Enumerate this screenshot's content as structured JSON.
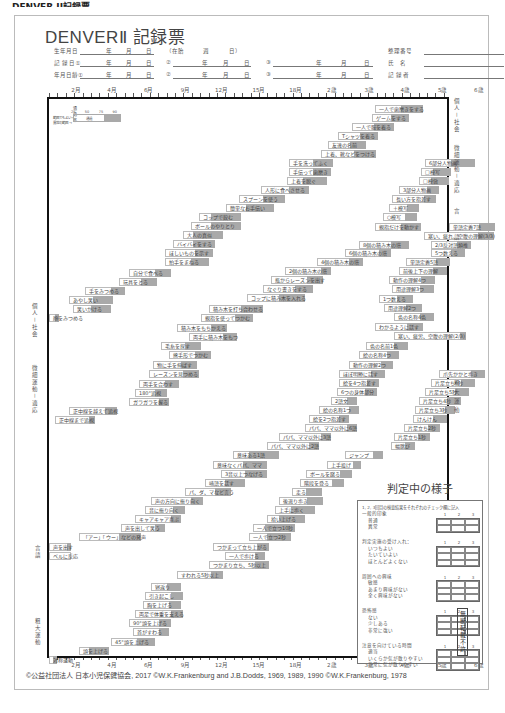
{
  "top_caption": "DENVER II記録票",
  "form": {
    "title": "DENVERⅡ 記録票",
    "rows": [
      {
        "label": "生年月日",
        "fields": [
          "年",
          "月",
          "日"
        ],
        "extra": [
          "（在胎",
          "週",
          "日）"
        ],
        "right_label": "整理番号"
      },
      {
        "label": "記 録 日①",
        "fields": [
          "年",
          "月",
          "日"
        ],
        "second": [
          "②",
          "年",
          "月",
          "日"
        ],
        "third": [
          "③",
          "年",
          "月",
          "日"
        ],
        "right_label": "氏　名"
      },
      {
        "label": "年月日齢①",
        "fields": [
          "年",
          "月",
          "日"
        ],
        "second": [
          "②",
          "年",
          "月",
          "日"
        ],
        "third": [
          "③",
          "年",
          "月",
          "日"
        ],
        "right_label": "記 録 者"
      }
    ]
  },
  "axis": {
    "labels": [
      "2月",
      "4月",
      "6月",
      "9月",
      "12月",
      "15月",
      "18月",
      "2歳",
      "3歳",
      "4歳",
      "5歳",
      "6歳"
    ],
    "positions": [
      78,
      128,
      178,
      228,
      278,
      328,
      378,
      428,
      478,
      528,
      578,
      628
    ]
  },
  "legend": {
    "title": "通過率",
    "ticks": [
      "25",
      "50",
      "75",
      "90"
    ],
    "left_top": "範囲でもよい→",
    "left_bottom": "異常の範囲 →",
    "mid": "通過"
  },
  "categories_right": [
    "個人－社会",
    "微細運動－適応",
    "言語",
    "粗大運動"
  ],
  "categories_left": [
    "個人－社会",
    "微細運動－適応",
    "言語",
    "粗大運動"
  ],
  "chart_data": {
    "type": "table",
    "title": "DENVERⅡ 記録票",
    "xlabel": "月齢・年齢",
    "x_ticks": [
      "2月",
      "4月",
      "6月",
      "9月",
      "12月",
      "15月",
      "18月",
      "2歳",
      "3歳",
      "4歳",
      "5歳",
      "6歳"
    ],
    "items": [
      {
        "label": "一人で歯磨きをする",
        "x": 326,
        "y": 6,
        "w": 48,
        "s": 22
      },
      {
        "label": "ゲームをする",
        "x": 323,
        "y": 15,
        "w": 37,
        "s": 18
      },
      {
        "label": "一人で服を着る",
        "x": 303,
        "y": 24,
        "w": 42,
        "s": 20
      },
      {
        "label": "Tシャツを着る",
        "x": 289,
        "y": 33,
        "w": 40,
        "s": 18
      },
      {
        "label": "友達の名前",
        "x": 279,
        "y": 42,
        "w": 38,
        "s": 16
      },
      {
        "label": "上着、靴などをつける",
        "x": 272,
        "y": 51,
        "w": 55,
        "s": 22
      },
      {
        "label": "手を洗ってふく",
        "x": 240,
        "y": 60,
        "w": 44,
        "s": 20
      },
      {
        "label": "手伝って歯磨き",
        "x": 240,
        "y": 69,
        "w": 42,
        "s": 18
      },
      {
        "label": "上着を脱ぐ",
        "x": 238,
        "y": 78,
        "w": 40,
        "s": 24
      },
      {
        "label": "人形に食べさせる",
        "x": 212,
        "y": 87,
        "w": 48,
        "s": 20
      },
      {
        "label": "スプーンを使う",
        "x": 190,
        "y": 96,
        "w": 46,
        "s": 22
      },
      {
        "label": "簡単なお手伝い",
        "x": 177,
        "y": 105,
        "w": 48,
        "s": 28
      },
      {
        "label": "コップで飲む",
        "x": 150,
        "y": 114,
        "w": 42,
        "s": 30
      },
      {
        "label": "ボールのやりとり",
        "x": 142,
        "y": 123,
        "w": 50,
        "s": 30
      },
      {
        "label": "大人の真似",
        "x": 134,
        "y": 132,
        "w": 40,
        "s": 30
      },
      {
        "label": "バイバイをする",
        "x": 124,
        "y": 141,
        "w": 42,
        "s": 22
      },
      {
        "label": "ほしいものを示す",
        "x": 116,
        "y": 150,
        "w": 48,
        "s": 18
      },
      {
        "label": "拍手をまねる",
        "x": 116,
        "y": 159,
        "w": 44,
        "s": 18
      },
      {
        "label": "自分で食べる",
        "x": 80,
        "y": 170,
        "w": 42,
        "s": 16
      },
      {
        "label": "玩具をとる",
        "x": 70,
        "y": 179,
        "w": 38,
        "s": 16
      },
      {
        "label": "手をみつめる",
        "x": 36,
        "y": 188,
        "w": 40,
        "s": 14
      },
      {
        "label": "あやし笑い",
        "x": 20,
        "y": 197,
        "w": 44,
        "s": 20
      },
      {
        "label": "笑いかける",
        "x": 24,
        "y": 206,
        "w": 38,
        "s": 20
      },
      {
        "label": "顔をみつめる",
        "x": 0,
        "y": 215,
        "w": 10,
        "s": 4
      },
      {
        "label": "6部分人物画",
        "x": 376,
        "y": 60,
        "w": 50,
        "s": 24
      },
      {
        "label": "□模写",
        "x": 372,
        "y": 69,
        "w": 30,
        "s": 18
      },
      {
        "label": "□模倣",
        "x": 370,
        "y": 78,
        "w": 30,
        "s": 18
      },
      {
        "label": "3部分人物画",
        "x": 350,
        "y": 87,
        "w": 40,
        "s": 12
      },
      {
        "label": "長い方を指差す",
        "x": 343,
        "y": 96,
        "w": 44,
        "s": 12
      },
      {
        "label": "＋模写",
        "x": 340,
        "y": 105,
        "w": 30,
        "s": 12
      },
      {
        "label": "○模写",
        "x": 334,
        "y": 114,
        "w": 34,
        "s": 12
      },
      {
        "label": "親指だけを動かす",
        "x": 326,
        "y": 124,
        "w": 46,
        "s": 20
      },
      {
        "label": "8個の積み木の塔",
        "x": 310,
        "y": 142,
        "w": 50,
        "s": 18
      },
      {
        "label": "6個の積み木の塔",
        "x": 296,
        "y": 150,
        "w": 46,
        "s": 12
      },
      {
        "label": "4個の積み木の塔",
        "x": 268,
        "y": 159,
        "w": 46,
        "s": 14
      },
      {
        "label": "2個の積み木の塔",
        "x": 236,
        "y": 168,
        "w": 46,
        "s": 10
      },
      {
        "label": "瓶からレーズンを出す",
        "x": 222,
        "y": 177,
        "w": 52,
        "s": 16
      },
      {
        "label": "なぐり書きをする",
        "x": 214,
        "y": 186,
        "w": 50,
        "s": 18
      },
      {
        "label": "コップに積み木を入れる",
        "x": 198,
        "y": 195,
        "w": 58,
        "s": 26
      },
      {
        "label": "積み木を打ち合わせる",
        "x": 160,
        "y": 206,
        "w": 54,
        "s": 22
      },
      {
        "label": "親指を使ってつかむ",
        "x": 152,
        "y": 215,
        "w": 52,
        "s": 18
      },
      {
        "label": "積み木をもちかえる",
        "x": 128,
        "y": 225,
        "w": 50,
        "s": 16
      },
      {
        "label": "両手に積み木をもつ",
        "x": 140,
        "y": 234,
        "w": 48,
        "s": 14
      },
      {
        "label": "毛糸を探す",
        "x": 112,
        "y": 243,
        "w": 40,
        "s": 16
      },
      {
        "label": "熊手形でつかむ",
        "x": 120,
        "y": 252,
        "w": 42,
        "s": 16
      },
      {
        "label": "物に手を伸ばす",
        "x": 104,
        "y": 262,
        "w": 44,
        "s": 16
      },
      {
        "label": "レーズンを見つめる",
        "x": 100,
        "y": 271,
        "w": 50,
        "s": 16
      },
      {
        "label": "両手を合わす",
        "x": 90,
        "y": 281,
        "w": 40,
        "s": 14
      },
      {
        "label": "180°追視",
        "x": 86,
        "y": 290,
        "w": 32,
        "s": 12
      },
      {
        "label": "ガラガラを握る",
        "x": 80,
        "y": 299,
        "w": 40,
        "s": 10
      },
      {
        "label": "正中線を越えて追視",
        "x": 20,
        "y": 308,
        "w": 48,
        "s": 12
      },
      {
        "label": "正中線まで追視",
        "x": 6,
        "y": 317,
        "w": 40,
        "s": 6
      },
      {
        "label": "単語定義7語",
        "x": 400,
        "y": 124,
        "w": 46,
        "s": 16
      },
      {
        "label": "寒い、疲れ、空腹の理解(3/3)",
        "x": 375,
        "y": 133,
        "w": 70,
        "s": 16
      },
      {
        "label": "2/3反対語類推",
        "x": 382,
        "y": 142,
        "w": 40,
        "s": 14
      },
      {
        "label": "5つ数える",
        "x": 382,
        "y": 150,
        "w": 34,
        "s": 14
      },
      {
        "label": "単語定義5語",
        "x": 357,
        "y": 159,
        "w": 44,
        "s": 14
      },
      {
        "label": "前後上下の理解",
        "x": 350,
        "y": 168,
        "w": 48,
        "s": 14
      },
      {
        "label": "動作の理解4つ",
        "x": 340,
        "y": 177,
        "w": 46,
        "s": 14
      },
      {
        "label": "用途理解3つ",
        "x": 343,
        "y": 186,
        "w": 42,
        "s": 14
      },
      {
        "label": "1つ数える",
        "x": 330,
        "y": 196,
        "w": 34,
        "s": 16
      },
      {
        "label": "用途理解2つ",
        "x": 335,
        "y": 205,
        "w": 38,
        "s": 16
      },
      {
        "label": "色の名称4色",
        "x": 345,
        "y": 214,
        "w": 40,
        "s": 14
      },
      {
        "label": "わかるように話す",
        "x": 326,
        "y": 224,
        "w": 48,
        "s": 16
      },
      {
        "label": "寒い、疲労、空腹の理解(2/3)",
        "x": 345,
        "y": 233,
        "w": 72,
        "s": 6
      },
      {
        "label": "色の名前1色",
        "x": 317,
        "y": 243,
        "w": 42,
        "s": 14
      },
      {
        "label": "絵の名称4つ",
        "x": 310,
        "y": 252,
        "w": 40,
        "s": 12
      },
      {
        "label": "動作の理解2つ",
        "x": 300,
        "y": 262,
        "w": 44,
        "s": 12
      },
      {
        "label": "ほぼ明瞭に話す",
        "x": 290,
        "y": 271,
        "w": 46,
        "s": 14
      },
      {
        "label": "絵を4つ指差す",
        "x": 290,
        "y": 280,
        "w": 40,
        "s": 12
      },
      {
        "label": "6つの身体部分",
        "x": 288,
        "y": 289,
        "w": 40,
        "s": 12
      },
      {
        "label": "2語文",
        "x": 282,
        "y": 298,
        "w": 26,
        "s": 10
      },
      {
        "label": "絵の名称1つ",
        "x": 270,
        "y": 307,
        "w": 40,
        "s": 10
      },
      {
        "label": "絵を2つ指差す",
        "x": 260,
        "y": 316,
        "w": 40,
        "s": 10
      },
      {
        "label": "パパ、ママ以外に6語",
        "x": 256,
        "y": 325,
        "w": 52,
        "s": 10
      },
      {
        "label": "パパ、ママ以外に3語",
        "x": 230,
        "y": 334,
        "w": 52,
        "s": 10
      },
      {
        "label": "パパ、ママ以外に2語",
        "x": 218,
        "y": 343,
        "w": 52,
        "s": 10
      },
      {
        "label": "意味ある1語",
        "x": 184,
        "y": 352,
        "w": 46,
        "s": 30
      },
      {
        "label": "意味なくパパ、ママ",
        "x": 164,
        "y": 362,
        "w": 54,
        "s": 24
      },
      {
        "label": "3音以上つなげる",
        "x": 172,
        "y": 371,
        "w": 46,
        "s": 22
      },
      {
        "label": "喃語を話す",
        "x": 156,
        "y": 380,
        "w": 40,
        "s": 20
      },
      {
        "label": "パ、ダ、マなど言う",
        "x": 136,
        "y": 389,
        "w": 46,
        "s": 16
      },
      {
        "label": "声の方向に振り向く",
        "x": 102,
        "y": 398,
        "w": 52,
        "s": 12
      },
      {
        "label": "音に振り向く",
        "x": 96,
        "y": 407,
        "w": 40,
        "s": 12
      },
      {
        "label": "キャアキャア喜ぶ",
        "x": 86,
        "y": 416,
        "w": 46,
        "s": 10
      },
      {
        "label": "声を出して笑う",
        "x": 72,
        "y": 425,
        "w": 44,
        "s": 10
      },
      {
        "label": "「アー」「ウー」などの発声",
        "x": 30,
        "y": 434,
        "w": 62,
        "s": 22
      },
      {
        "label": "声を出す",
        "x": 0,
        "y": 444,
        "w": 22,
        "s": 4
      },
      {
        "label": "ベルに反応",
        "x": 0,
        "y": 453,
        "w": 22,
        "s": 0
      },
      {
        "label": "爪先かかと歩き",
        "x": 390,
        "y": 271,
        "w": 46,
        "s": 14
      },
      {
        "label": "片足立ち6秒",
        "x": 382,
        "y": 280,
        "w": 44,
        "s": 14
      },
      {
        "label": "片足立ち5秒",
        "x": 376,
        "y": 289,
        "w": 44,
        "s": 14
      },
      {
        "label": "片足立ち4秒",
        "x": 370,
        "y": 298,
        "w": 42,
        "s": 14
      },
      {
        "label": "片足立ち3秒",
        "x": 366,
        "y": 307,
        "w": 40,
        "s": 10
      },
      {
        "label": "けんけん",
        "x": 364,
        "y": 316,
        "w": 34,
        "s": 14
      },
      {
        "label": "片足立ち2秒",
        "x": 355,
        "y": 325,
        "w": 36,
        "s": 12
      },
      {
        "label": "片足立ち1秒",
        "x": 345,
        "y": 334,
        "w": 36,
        "s": 12
      },
      {
        "label": "幅跳び",
        "x": 342,
        "y": 343,
        "w": 24,
        "s": 10
      },
      {
        "label": "ジャンプ",
        "x": 296,
        "y": 352,
        "w": 38,
        "s": 10
      },
      {
        "label": "上手投げ",
        "x": 278,
        "y": 362,
        "w": 34,
        "s": 8
      },
      {
        "label": "ボールを蹴る",
        "x": 257,
        "y": 371,
        "w": 46,
        "s": 12
      },
      {
        "label": "階段を登る",
        "x": 251,
        "y": 380,
        "w": 44,
        "s": 12
      },
      {
        "label": "走る",
        "x": 243,
        "y": 389,
        "w": 30,
        "s": 16
      },
      {
        "label": "後退り歩き",
        "x": 230,
        "y": 398,
        "w": 44,
        "s": 16
      },
      {
        "label": "上手に歩く",
        "x": 226,
        "y": 407,
        "w": 40,
        "s": 24
      },
      {
        "label": "拾い上げる",
        "x": 218,
        "y": 416,
        "w": 38,
        "s": 26
      },
      {
        "label": "一人で立つ10秒",
        "x": 204,
        "y": 425,
        "w": 42,
        "s": 30
      },
      {
        "label": "一人で立つ2秒",
        "x": 200,
        "y": 434,
        "w": 42,
        "s": 24
      },
      {
        "label": "つかまって立ち上がる",
        "x": 164,
        "y": 444,
        "w": 56,
        "s": 12
      },
      {
        "label": "一人で歩ける",
        "x": 176,
        "y": 453,
        "w": 40,
        "s": 10
      },
      {
        "label": "つかまり立ち、5秒以上",
        "x": 160,
        "y": 462,
        "w": 60,
        "s": 14
      },
      {
        "label": "すわれる5秒以上",
        "x": 128,
        "y": 472,
        "w": 46,
        "s": 12
      },
      {
        "label": "寝返り",
        "x": 102,
        "y": 484,
        "w": 30,
        "s": 14
      },
      {
        "label": "引き起こし",
        "x": 96,
        "y": 493,
        "w": 38,
        "s": 12
      },
      {
        "label": "胸を上げる",
        "x": 94,
        "y": 502,
        "w": 38,
        "s": 12
      },
      {
        "label": "両足で体重を支える",
        "x": 86,
        "y": 511,
        "w": 48,
        "s": 12
      },
      {
        "label": "90°頭を上げる",
        "x": 80,
        "y": 520,
        "w": 42,
        "s": 12
      },
      {
        "label": "首がすわる",
        "x": 84,
        "y": 529,
        "w": 36,
        "s": 10
      },
      {
        "label": "45°頭を上げる",
        "x": 62,
        "y": 539,
        "w": 44,
        "s": 18
      },
      {
        "label": "頭を上げる",
        "x": 30,
        "y": 548,
        "w": 30,
        "s": 20
      },
      {
        "label": "対称運動",
        "x": 0,
        "y": 557,
        "w": 8,
        "s": 4
      }
    ]
  },
  "judgment": {
    "title": "判定中の様子",
    "instruction": "1, 2, 3回目の検査結果をそれぞれのチェック欄に記入",
    "col_nums": [
      "1",
      "2",
      "3"
    ],
    "sections": [
      {
        "label": "一般的印象",
        "options": [
          "普通",
          "異常"
        ]
      },
      {
        "label": "判定実施の受け入れ：",
        "options": [
          "いつもよい",
          "たいていよい",
          "ほとんどよくない"
        ]
      },
      {
        "label": "周囲への興味",
        "options": [
          "敏感",
          "あまり興味がない",
          "全く興味がない"
        ]
      },
      {
        "label": "恐怖感",
        "options": [
          "ない",
          "少しある",
          "非常に強い"
        ]
      },
      {
        "label": "注意を向けている時間",
        "options": [
          "適当",
          "いくらか気が散りやすい",
          "非常に気が散りやすい"
        ]
      }
    ]
  },
  "stamp": "無断転載不許",
  "copyright": "©公益社団法人 日本小児保健協会, 2017 ©W.K.Frankenburg and J.B.Dodds, 1969, 1989, 1990 ©W.K.Frankenburg, 1978"
}
